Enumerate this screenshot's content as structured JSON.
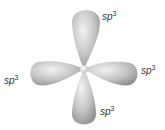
{
  "diagram": {
    "center": {
      "x": 84,
      "y": 69
    },
    "colors": {
      "lobe_light": "#e8e8e8",
      "lobe_mid": "#bdbdbd",
      "lobe_dark": "#8a8a8a",
      "label": "#333333"
    },
    "labels": [
      {
        "id": "top",
        "base": "sp",
        "exp": "3",
        "x": 102,
        "y": 12
      },
      {
        "id": "left",
        "base": "sp",
        "exp": "3",
        "x": 4,
        "y": 76
      },
      {
        "id": "right",
        "base": "sp",
        "exp": "3",
        "x": 141,
        "y": 66
      },
      {
        "id": "bottom",
        "base": "sp",
        "exp": "3",
        "x": 100,
        "y": 107
      }
    ]
  }
}
